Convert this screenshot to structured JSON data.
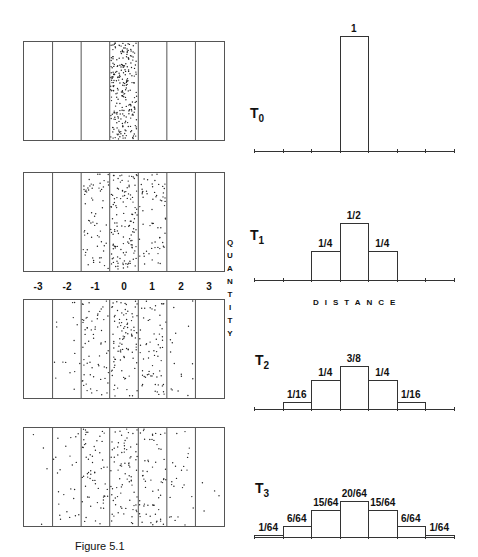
{
  "figure": {
    "caption": "Figure 5.1",
    "axis_quantity": "QUANTITY",
    "axis_distance": "DISTANCE",
    "positions": [
      "-3",
      "-2",
      "-1",
      "0",
      "1",
      "2",
      "3"
    ]
  },
  "panels": [
    {
      "time_label": "T",
      "time_sub": "0",
      "labels": [
        "",
        "",
        "",
        "1",
        "",
        "",
        ""
      ]
    },
    {
      "time_label": "T",
      "time_sub": "1",
      "labels": [
        "",
        "",
        "1/4",
        "1/2",
        "1/4",
        "",
        ""
      ]
    },
    {
      "time_label": "T",
      "time_sub": "2",
      "labels": [
        "",
        "1/16",
        "1/4",
        "3/8",
        "1/4",
        "1/16",
        ""
      ]
    },
    {
      "time_label": "T",
      "time_sub": "3",
      "labels": [
        "1/64",
        "6/64",
        "15/64",
        "20/64",
        "15/64",
        "6/64",
        "1/64"
      ]
    }
  ],
  "chart_data": [
    {
      "type": "bar",
      "title": "T0",
      "categories": [
        "-3",
        "-2",
        "-1",
        "0",
        "1",
        "2",
        "3"
      ],
      "values": [
        0,
        0,
        0,
        1,
        0,
        0,
        0
      ],
      "xlabel": "DISTANCE",
      "ylabel": "QUANTITY"
    },
    {
      "type": "bar",
      "title": "T1",
      "categories": [
        "-3",
        "-2",
        "-1",
        "0",
        "1",
        "2",
        "3"
      ],
      "values": [
        0,
        0,
        0.25,
        0.5,
        0.25,
        0,
        0
      ],
      "xlabel": "DISTANCE",
      "ylabel": "QUANTITY"
    },
    {
      "type": "bar",
      "title": "T2",
      "categories": [
        "-3",
        "-2",
        "-1",
        "0",
        "1",
        "2",
        "3"
      ],
      "values": [
        0,
        0.0625,
        0.25,
        0.375,
        0.25,
        0.0625,
        0
      ],
      "xlabel": "DISTANCE",
      "ylabel": "QUANTITY"
    },
    {
      "type": "bar",
      "title": "T3",
      "categories": [
        "-3",
        "-2",
        "-1",
        "0",
        "1",
        "2",
        "3"
      ],
      "values": [
        0.015625,
        0.09375,
        0.234375,
        0.3125,
        0.234375,
        0.09375,
        0.015625
      ],
      "xlabel": "DISTANCE",
      "ylabel": "QUANTITY"
    }
  ]
}
